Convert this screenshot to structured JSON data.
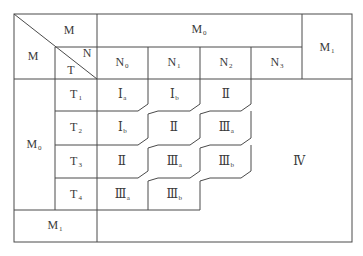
{
  "table": {
    "corner": {
      "top_right": "M",
      "left": "M",
      "inner_top_right": "N",
      "inner_bottom_left": "T"
    },
    "header": {
      "group_M0": {
        "base": "M",
        "sub": "0"
      },
      "group_M1": {
        "base": "M",
        "sub": "1"
      },
      "columns": [
        {
          "base": "N",
          "sub": "0"
        },
        {
          "base": "N",
          "sub": "1"
        },
        {
          "base": "N",
          "sub": "2"
        },
        {
          "base": "N",
          "sub": "3"
        }
      ]
    },
    "row_group_M0": {
      "base": "M",
      "sub": "0"
    },
    "row_group_M1": {
      "base": "M",
      "sub": "1"
    },
    "rows": [
      {
        "label": {
          "base": "T",
          "sub": "1"
        },
        "cells": [
          {
            "base": "Ⅰ",
            "sub": "a"
          },
          {
            "base": "Ⅰ",
            "sub": "b"
          },
          {
            "base": "Ⅱ",
            "sub": ""
          }
        ]
      },
      {
        "label": {
          "base": "T",
          "sub": "2"
        },
        "cells": [
          {
            "base": "Ⅰ",
            "sub": "b"
          },
          {
            "base": "Ⅱ",
            "sub": ""
          },
          {
            "base": "Ⅲ",
            "sub": "a"
          }
        ]
      },
      {
        "label": {
          "base": "T",
          "sub": "3"
        },
        "cells": [
          {
            "base": "Ⅱ",
            "sub": ""
          },
          {
            "base": "Ⅲ",
            "sub": "a"
          },
          {
            "base": "Ⅲ",
            "sub": "b"
          }
        ]
      },
      {
        "label": {
          "base": "T",
          "sub": "4"
        },
        "cells": [
          {
            "base": "Ⅲ",
            "sub": "a"
          },
          {
            "base": "Ⅲ",
            "sub": "b"
          }
        ]
      }
    ],
    "region_IV": "Ⅳ"
  },
  "colors": {
    "line": "#4a4a4a",
    "text": "#3a3a3a",
    "background": "#ffffff"
  }
}
